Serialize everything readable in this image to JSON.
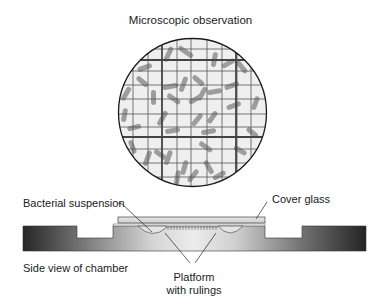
{
  "title": "Microscopic observation",
  "labels": {
    "bacterial_suspension": "Bacterial suspension",
    "cover_glass": "Cover glass",
    "side_view": "Side view of chamber",
    "platform_line1": "Platform",
    "platform_line2": "with rulings"
  },
  "microscope_view": {
    "shape": "circle",
    "center": [
      192.5,
      112.5
    ],
    "radius": 74,
    "grid": "counting chamber rulings, thin lines with heavier lines at intervals",
    "content": "rod-shaped bacterial cells scattered over grid"
  },
  "colors": {
    "text": "#1a1a1a",
    "field_bg": "#eeeeee",
    "grid": "#555555",
    "bacteria": "#8a8a8a",
    "chamber_dark": "#2a2a2a",
    "chamber_light": "#e8e8e8",
    "cover_glass": "#d9d9d9"
  }
}
